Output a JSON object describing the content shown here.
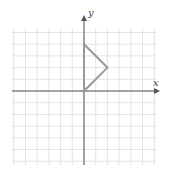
{
  "diagram": {
    "type": "coordinate-grid",
    "axes": {
      "x_label": "x",
      "y_label": "y"
    },
    "grid": {
      "x_range": [
        -6,
        6
      ],
      "y_range": [
        -6,
        5
      ],
      "origin_px": [
        84,
        91
      ],
      "unit_px": 11.7
    },
    "shape": {
      "name": "triangle",
      "vertices": [
        [
          0,
          0
        ],
        [
          0,
          4
        ],
        [
          2,
          2
        ]
      ],
      "stroke": "#999999"
    },
    "colors": {
      "grid": "#e4e4e4",
      "axis": "#555555"
    }
  }
}
